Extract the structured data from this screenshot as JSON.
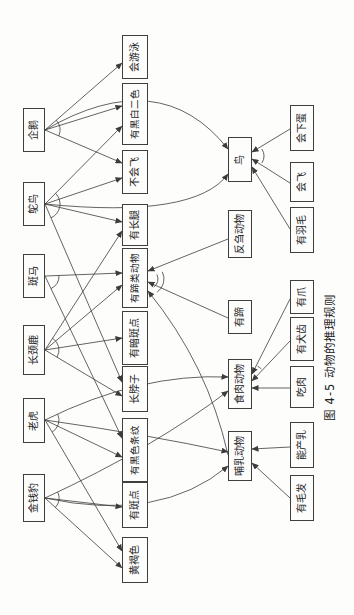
{
  "figure": {
    "caption": "图 4-5  动物的推理规则",
    "colors": {
      "page_bg": "#fdfdfc",
      "line": "#3c3c3c",
      "text": "#1c1c1c"
    },
    "rotation_deg": -90
  },
  "diagram": {
    "nodes": [
      {
        "id": "leopard",
        "label": "金钱豹",
        "x": 93,
        "y": 23,
        "w": 48,
        "h": 22
      },
      {
        "id": "tiger",
        "label": "老虎",
        "x": 172,
        "y": 23,
        "w": 45,
        "h": 22
      },
      {
        "id": "giraffe",
        "label": "长颈鹿",
        "x": 240,
        "y": 23,
        "w": 50,
        "h": 22
      },
      {
        "id": "zebra",
        "label": "斑马",
        "x": 317,
        "y": 23,
        "w": 44,
        "h": 22
      },
      {
        "id": "ostrich",
        "label": "鸵鸟",
        "x": 389,
        "y": 23,
        "w": 44,
        "h": 22
      },
      {
        "id": "penguin",
        "label": "企鹅",
        "x": 463,
        "y": 23,
        "w": 44,
        "h": 22
      },
      {
        "id": "tawny",
        "label": "黄褐色",
        "x": 32,
        "y": 122,
        "w": 46,
        "h": 26
      },
      {
        "id": "spots",
        "label": "有斑点",
        "x": 87,
        "y": 122,
        "w": 46,
        "h": 26
      },
      {
        "id": "stripes",
        "label": "有黑色条纹",
        "x": 133,
        "y": 122,
        "w": 64,
        "h": 26
      },
      {
        "id": "neck",
        "label": "长脖子",
        "x": 203,
        "y": 122,
        "w": 46,
        "h": 26
      },
      {
        "id": "darkspots",
        "label": "有暗斑点",
        "x": 250,
        "y": 122,
        "w": 54,
        "h": 26
      },
      {
        "id": "ungulate",
        "label": "有蹄类动物",
        "x": 307,
        "y": 122,
        "w": 60,
        "h": 26
      },
      {
        "id": "legs",
        "label": "有长腿",
        "x": 369,
        "y": 122,
        "w": 42,
        "h": 26
      },
      {
        "id": "cantfly",
        "label": "不会飞",
        "x": 421,
        "y": 122,
        "w": 44,
        "h": 26
      },
      {
        "id": "bw",
        "label": "有黑白二色",
        "x": 470,
        "y": 122,
        "w": 62,
        "h": 26
      },
      {
        "id": "swim",
        "label": "会游泳",
        "x": 536,
        "y": 122,
        "w": 44,
        "h": 26
      },
      {
        "id": "mammal",
        "label": "哺乳动物",
        "x": 134,
        "y": 228,
        "w": 50,
        "h": 24
      },
      {
        "id": "carnivore",
        "label": "食肉动物",
        "x": 206,
        "y": 228,
        "w": 50,
        "h": 24
      },
      {
        "id": "hoofs",
        "label": "有蹄",
        "x": 281,
        "y": 228,
        "w": 34,
        "h": 24
      },
      {
        "id": "cud",
        "label": "反刍动物",
        "x": 357,
        "y": 228,
        "w": 48,
        "h": 24
      },
      {
        "id": "bird",
        "label": "鸟",
        "x": 433,
        "y": 228,
        "w": 45,
        "h": 24
      },
      {
        "id": "hair",
        "label": "有毛发",
        "x": 94,
        "y": 290,
        "w": 46,
        "h": 24
      },
      {
        "id": "milk",
        "label": "能产乳",
        "x": 147,
        "y": 290,
        "w": 46,
        "h": 24
      },
      {
        "id": "meat",
        "label": "吃肉",
        "x": 207,
        "y": 290,
        "w": 42,
        "h": 24
      },
      {
        "id": "canine",
        "label": "有犬齿",
        "x": 254,
        "y": 290,
        "w": 44,
        "h": 24
      },
      {
        "id": "claws",
        "label": "有爪",
        "x": 301,
        "y": 290,
        "w": 34,
        "h": 24
      },
      {
        "id": "feathers",
        "label": "有羽毛",
        "x": 362,
        "y": 290,
        "w": 46,
        "h": 24
      },
      {
        "id": "fly",
        "label": "会飞",
        "x": 413,
        "y": 290,
        "w": 40,
        "h": 24
      },
      {
        "id": "eggs",
        "label": "会下蛋",
        "x": 464,
        "y": 290,
        "w": 46,
        "h": 24
      }
    ],
    "edges": [
      {
        "from": "penguin",
        "to": "swim",
        "x1": 485,
        "y1": 45,
        "x2": 552,
        "y2": 122
      },
      {
        "from": "penguin",
        "to": "cantfly",
        "x1": 485,
        "y1": 45,
        "x2": 452,
        "y2": 122
      },
      {
        "from": "penguin",
        "to": "bw",
        "x1": 485,
        "y1": 45,
        "x2": 509,
        "y2": 122
      },
      {
        "from": "penguin",
        "to": "bird",
        "x1": 485,
        "y1": 45,
        "cx": 552,
        "cy": 160,
        "x2": 466,
        "y2": 228
      },
      {
        "from": "ostrich",
        "to": "bw",
        "x1": 411,
        "y1": 45,
        "x2": 489,
        "y2": 122
      },
      {
        "from": "ostrich",
        "to": "cantfly",
        "x1": 411,
        "y1": 45,
        "x2": 437,
        "y2": 122
      },
      {
        "from": "ostrich",
        "to": "legs",
        "x1": 411,
        "y1": 45,
        "x2": 393,
        "y2": 122
      },
      {
        "from": "ostrich",
        "to": "neck",
        "x1": 411,
        "y1": 45,
        "x2": 233,
        "y2": 122
      },
      {
        "from": "ostrich",
        "to": "bird",
        "x1": 411,
        "y1": 45,
        "cx": 396,
        "cy": 195,
        "x2": 441,
        "y2": 228
      },
      {
        "from": "zebra",
        "to": "ungulate",
        "x1": 339,
        "y1": 45,
        "x2": 342,
        "y2": 122
      },
      {
        "from": "zebra",
        "to": "stripes",
        "x1": 339,
        "y1": 45,
        "x2": 177,
        "y2": 122
      },
      {
        "from": "giraffe",
        "to": "ungulate",
        "x1": 265,
        "y1": 45,
        "x2": 330,
        "y2": 122
      },
      {
        "from": "giraffe",
        "to": "legs",
        "x1": 265,
        "y1": 45,
        "x2": 384,
        "y2": 122
      },
      {
        "from": "giraffe",
        "to": "neck",
        "x1": 265,
        "y1": 45,
        "x2": 219,
        "y2": 122
      },
      {
        "from": "giraffe",
        "to": "darkspots",
        "x1": 265,
        "y1": 45,
        "x2": 277,
        "y2": 122
      },
      {
        "from": "tiger",
        "to": "mammal",
        "x1": 195,
        "y1": 45,
        "cx": 180,
        "cy": 150,
        "x2": 163,
        "y2": 228
      },
      {
        "from": "tiger",
        "to": "carnivore",
        "x1": 195,
        "y1": 45,
        "cx": 242,
        "cy": 140,
        "x2": 238,
        "y2": 228
      },
      {
        "from": "tiger",
        "to": "tawny",
        "x1": 195,
        "y1": 45,
        "x2": 64,
        "y2": 122
      },
      {
        "from": "tiger",
        "to": "stripes",
        "x1": 195,
        "y1": 45,
        "x2": 158,
        "y2": 122
      },
      {
        "from": "leopard",
        "to": "mammal",
        "x1": 117,
        "y1": 45,
        "cx": 92,
        "cy": 160,
        "x2": 149,
        "y2": 228
      },
      {
        "from": "leopard",
        "to": "carnivore",
        "x1": 117,
        "y1": 45,
        "cx": 168,
        "cy": 155,
        "x2": 224,
        "y2": 228
      },
      {
        "from": "leopard",
        "to": "tawny",
        "x1": 117,
        "y1": 45,
        "x2": 47,
        "y2": 122
      },
      {
        "from": "leopard",
        "to": "spots",
        "x1": 117,
        "y1": 45,
        "x2": 108,
        "y2": 122
      },
      {
        "from": "hair",
        "to": "mammal",
        "x1": 117,
        "y1": 290,
        "x2": 152,
        "y2": 252
      },
      {
        "from": "milk",
        "to": "mammal",
        "x1": 168,
        "y1": 290,
        "x2": 166,
        "y2": 252
      },
      {
        "from": "meat",
        "to": "carnivore",
        "x1": 227,
        "y1": 290,
        "x2": 227,
        "y2": 252
      },
      {
        "from": "canine",
        "to": "carnivore",
        "x1": 274,
        "y1": 290,
        "x2": 234,
        "y2": 252
      },
      {
        "from": "claws",
        "to": "carnivore",
        "x1": 316,
        "y1": 290,
        "x2": 241,
        "y2": 252
      },
      {
        "from": "feathers",
        "to": "bird",
        "x1": 386,
        "y1": 290,
        "x2": 448,
        "y2": 252
      },
      {
        "from": "fly",
        "to": "bird",
        "x1": 432,
        "y1": 290,
        "x2": 456,
        "y2": 252
      },
      {
        "from": "eggs",
        "to": "bird",
        "x1": 486,
        "y1": 290,
        "x2": 463,
        "y2": 252
      },
      {
        "from": "hoofs",
        "to": "ungulate",
        "x1": 297,
        "y1": 228,
        "x2": 333,
        "y2": 148
      },
      {
        "from": "cud",
        "to": "ungulate",
        "x1": 376,
        "y1": 228,
        "x2": 344,
        "y2": 148
      },
      {
        "from": "mammal",
        "to": "ungulate",
        "x1": 160,
        "y1": 228,
        "cx": 250,
        "cy": 208,
        "x2": 324,
        "y2": 148
      }
    ],
    "and_arcs": [
      {
        "at": "penguin",
        "x": 485,
        "y": 45,
        "r": 15,
        "pts": [
          [
            552,
            122
          ],
          [
            452,
            122
          ],
          [
            509,
            122
          ],
          [
            540,
            150
          ]
        ]
      },
      {
        "at": "ostrich",
        "x": 411,
        "y": 45,
        "r": 15,
        "pts": [
          [
            489,
            122
          ],
          [
            437,
            122
          ],
          [
            393,
            122
          ],
          [
            233,
            122
          ],
          [
            400,
            180
          ]
        ]
      },
      {
        "at": "zebra",
        "x": 339,
        "y": 45,
        "r": 14,
        "pts": [
          [
            342,
            122
          ],
          [
            177,
            122
          ]
        ]
      },
      {
        "at": "giraffe",
        "x": 265,
        "y": 45,
        "r": 14,
        "pts": [
          [
            330,
            122
          ],
          [
            384,
            122
          ],
          [
            219,
            122
          ],
          [
            277,
            122
          ]
        ]
      },
      {
        "at": "tiger",
        "x": 195,
        "y": 45,
        "r": 14,
        "pts": [
          [
            64,
            122
          ],
          [
            158,
            122
          ],
          [
            183,
            140
          ],
          [
            235,
            135
          ]
        ]
      },
      {
        "at": "leopard",
        "x": 117,
        "y": 45,
        "r": 14,
        "pts": [
          [
            47,
            122
          ],
          [
            108,
            122
          ],
          [
            97,
            150
          ],
          [
            163,
            148
          ]
        ]
      },
      {
        "at": "bird",
        "x": 459,
        "y": 252,
        "r": 12,
        "pts": [
          [
            432,
            290
          ],
          [
            486,
            290
          ]
        ]
      },
      {
        "at": "carnivore",
        "x": 237,
        "y": 252,
        "r": 13,
        "pts": [
          [
            274,
            290
          ],
          [
            316,
            290
          ]
        ]
      },
      {
        "at": "ungulate",
        "x": 336,
        "y": 148,
        "r": 10,
        "pts": [
          [
            250,
            208
          ],
          [
            297,
            228
          ],
          [
            376,
            228
          ]
        ]
      },
      {
        "at": "ungulate",
        "x": 336,
        "y": 148,
        "r": 16,
        "pts": [
          [
            250,
            208
          ],
          [
            297,
            228
          ],
          [
            376,
            228
          ]
        ]
      }
    ]
  }
}
